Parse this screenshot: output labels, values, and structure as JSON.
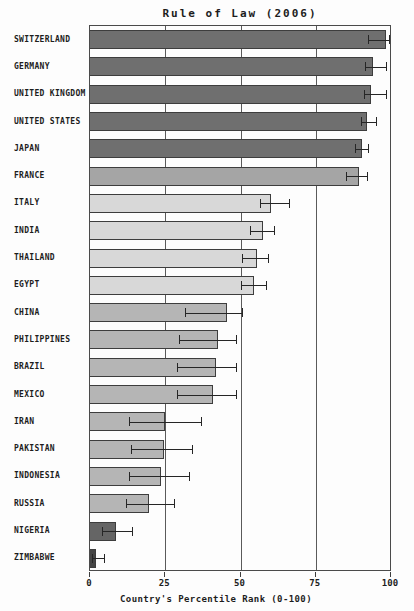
{
  "chart_data": {
    "type": "bar",
    "orientation": "horizontal",
    "title": "Rule of Law (2006)",
    "xlabel": "Country's Percentile Rank (0-100)",
    "xlim": [
      0,
      100
    ],
    "xticks": [
      0,
      25,
      50,
      75,
      100
    ],
    "gridlines": [
      25,
      50,
      75
    ],
    "grid": "on",
    "colors": {
      "dark": "#6f6f6f",
      "medium_dark": "#a5a5a5",
      "light": "#d8d8d8",
      "medium": "#b5b5b5",
      "darker": "#656565",
      "darkest": "#454545"
    },
    "series": [
      {
        "label": "SWITZERLAND",
        "value": 98.5,
        "err_low": 92.5,
        "err_high": 99.5,
        "color": "dark"
      },
      {
        "label": "GERMANY",
        "value": 94,
        "err_low": 91.5,
        "err_high": 98.5,
        "color": "dark"
      },
      {
        "label": "UNITED KINGDOM",
        "value": 93.5,
        "err_low": 91,
        "err_high": 98.5,
        "color": "dark"
      },
      {
        "label": "UNITED STATES",
        "value": 92,
        "err_low": 90,
        "err_high": 95,
        "color": "dark"
      },
      {
        "label": "JAPAN",
        "value": 90.5,
        "err_low": 88,
        "err_high": 92.5,
        "color": "dark"
      },
      {
        "label": "FRANCE",
        "value": 89.5,
        "err_low": 85,
        "err_high": 92,
        "color": "medium_dark"
      },
      {
        "label": "ITALY",
        "value": 60,
        "err_low": 56.5,
        "err_high": 66,
        "color": "light"
      },
      {
        "label": "INDIA",
        "value": 57.5,
        "err_low": 53,
        "err_high": 61,
        "color": "light"
      },
      {
        "label": "THAILAND",
        "value": 55.5,
        "err_low": 50.5,
        "err_high": 59,
        "color": "light"
      },
      {
        "label": "EGYPT",
        "value": 54.5,
        "err_low": 50,
        "err_high": 58.5,
        "color": "light"
      },
      {
        "label": "CHINA",
        "value": 45.5,
        "err_low": 31.5,
        "err_high": 50.5,
        "color": "medium"
      },
      {
        "label": "PHILIPPINES",
        "value": 42.5,
        "err_low": 29.5,
        "err_high": 48.5,
        "color": "medium"
      },
      {
        "label": "BRAZIL",
        "value": 42,
        "err_low": 29,
        "err_high": 48.5,
        "color": "medium"
      },
      {
        "label": "MEXICO",
        "value": 41,
        "err_low": 29,
        "err_high": 48.5,
        "color": "medium"
      },
      {
        "label": "IRAN",
        "value": 25,
        "err_low": 13,
        "err_high": 37,
        "color": "medium"
      },
      {
        "label": "PAKISTAN",
        "value": 24.5,
        "err_low": 13.5,
        "err_high": 34,
        "color": "medium"
      },
      {
        "label": "INDONESIA",
        "value": 23.5,
        "err_low": 13,
        "err_high": 33,
        "color": "medium"
      },
      {
        "label": "RUSSIA",
        "value": 19.5,
        "err_low": 12,
        "err_high": 28,
        "color": "medium"
      },
      {
        "label": "NIGERIA",
        "value": 8.5,
        "err_low": 4,
        "err_high": 14,
        "color": "darker"
      },
      {
        "label": "ZIMBABWE",
        "value": 2,
        "err_low": 0.5,
        "err_high": 4.5,
        "color": "darkest"
      }
    ]
  }
}
